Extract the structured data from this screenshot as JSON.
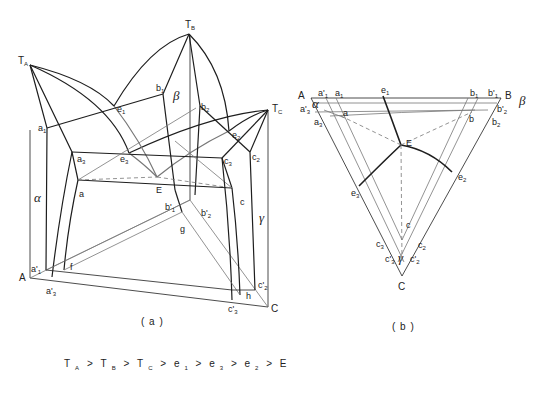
{
  "figure_a": {
    "caption": "( a )",
    "vertex_labels": {
      "TA": "T",
      "TA_sub": "A",
      "TB": "T",
      "TB_sub": "B",
      "TC": "T",
      "TC_sub": "C",
      "A": "A",
      "C": "C"
    },
    "point_labels": {
      "a1": "a",
      "a1_sub": "1",
      "b1": "b",
      "b1_sub": "1",
      "b2": "b",
      "b2_sub": "2",
      "e1": "e",
      "e1_sub": "1",
      "e2": "e",
      "e2_sub": "2",
      "e3": "e",
      "e3_sub": "3",
      "a3": "a",
      "a3_sub": "3",
      "c3": "c",
      "c3_sub": "3",
      "c2": "c",
      "c2_sub": "2",
      "E": "E",
      "a": "a",
      "c": "c",
      "b1p": "b'",
      "b1p_sub": "1",
      "b2p": "b'",
      "b2p_sub": "2",
      "g": "g",
      "f": "f",
      "h": "h",
      "a1p": "a'",
      "a1p_sub": "1",
      "a3p": "a'",
      "a3p_sub": "3",
      "c2p": "c'",
      "c2p_sub": "2",
      "c3p": "c'",
      "c3p_sub": "3"
    },
    "phase_labels": {
      "alpha": "α",
      "beta": "β",
      "gamma": "γ"
    }
  },
  "figure_b": {
    "caption": "( b )",
    "vertex_labels": {
      "A": "A",
      "B": "B",
      "C": "C"
    },
    "point_labels": {
      "a1p": "a'",
      "a1p_sub": "1",
      "a1": "a",
      "a1_sub": "1",
      "e1": "e",
      "e1_sub": "1",
      "b1": "b",
      "b1_sub": "1",
      "b1p": "b'",
      "b1p_sub": "1",
      "a3p": "a'",
      "a3p_sub": "3",
      "a": "a",
      "a3": "a",
      "a3_sub": "3",
      "b": "b",
      "b2p": "b'",
      "b2p_sub": "2",
      "b2": "b",
      "b2_sub": "2",
      "E": "E",
      "e2": "e",
      "e2_sub": "2",
      "e3": "e",
      "e3_sub": "3",
      "c": "c",
      "c3": "c",
      "c3_sub": "3",
      "c2": "c",
      "c2_sub": "2",
      "c3p": "c'",
      "c3p_sub": "3",
      "c2p": "c'",
      "c2p_sub": "2"
    },
    "phase_labels": {
      "alpha": "α",
      "beta": "β",
      "gamma": "γ"
    }
  },
  "temperature_order": {
    "terms": [
      {
        "base": "T",
        "sub": "A"
      },
      {
        "base": ">",
        "sub": ""
      },
      {
        "base": "T",
        "sub": "B"
      },
      {
        "base": ">",
        "sub": ""
      },
      {
        "base": "T",
        "sub": "C"
      },
      {
        "base": ">",
        "sub": ""
      },
      {
        "base": "e",
        "sub": "1"
      },
      {
        "base": ">",
        "sub": ""
      },
      {
        "base": "e",
        "sub": "3"
      },
      {
        "base": ">",
        "sub": ""
      },
      {
        "base": "e",
        "sub": "2"
      },
      {
        "base": ">",
        "sub": ""
      },
      {
        "base": "E",
        "sub": ""
      }
    ]
  }
}
